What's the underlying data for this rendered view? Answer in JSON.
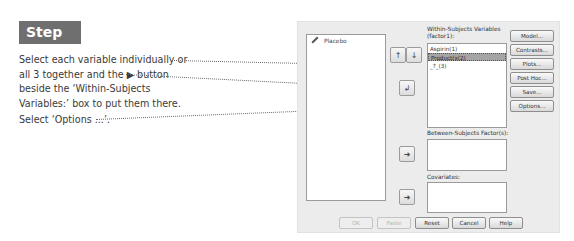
{
  "step": {
    "label": "Step 4:"
  },
  "instructions": [
    {
      "lines": [
        "Select each variable individually or",
        "all 3 together and the ▶ button",
        "beside the ‘Within-Subjects",
        "Variables:’ box to put them there."
      ]
    },
    {
      "lines": [
        "Select ‘Options ...’."
      ]
    }
  ],
  "dialog": {
    "source_list": {
      "items": [
        {
          "icon": "pencil-icon",
          "label": "Placebo"
        }
      ]
    },
    "within_subjects": {
      "label_line1": "Within-Subjects Variables",
      "label_line2": "(factor1):",
      "rows": [
        {
          "label": "Aspirin(1)",
          "selected": false
        },
        {
          "label": "Product(x(2)",
          "selected": true
        },
        {
          "label": "_?_(3)",
          "selected": false
        }
      ],
      "up_icon": "↑",
      "down_icon": "↓"
    },
    "move_arrows": {
      "within": "↲",
      "between": "➜",
      "covariates": "➜"
    },
    "between_subjects": {
      "label": "Between-Subjects Factor(s):"
    },
    "covariates": {
      "label": "Covariates:"
    },
    "side_buttons": [
      "Model...",
      "Contrasts...",
      "Plots...",
      "Post Hoc...",
      "Save...",
      "Options..."
    ],
    "bottom_buttons": [
      {
        "label": "OK",
        "disabled": true
      },
      {
        "label": "Paste",
        "disabled": true
      },
      {
        "label": "Reset",
        "disabled": false
      },
      {
        "label": "Cancel",
        "disabled": false
      },
      {
        "label": "Help",
        "disabled": false
      }
    ]
  }
}
